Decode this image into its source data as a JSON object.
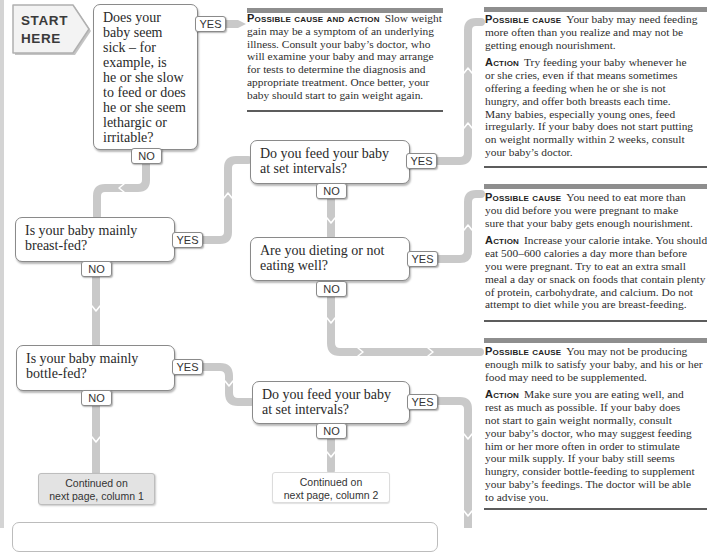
{
  "colors": {
    "connector": "#c9c9c9",
    "box_border": "#8a8a8a",
    "panel_bar": "#8e8e8e",
    "panel_rule": "#5c5c5c",
    "continued_fill": "#e3e3e3",
    "start_fill": "#f3f3f3"
  },
  "flowchart": {
    "start": {
      "line1": "START",
      "line2": "HERE"
    },
    "yes_label": "YES",
    "no_label": "NO",
    "questions": [
      {
        "id": "sick",
        "text": "Does your\nbaby seem\nsick – for\nexample, is\nhe or she slow\nto feed or does\nhe or she seem\nlethargic or\nirritable?"
      },
      {
        "id": "feed-set-intervals-breast",
        "text": "Do you feed your baby\nat set intervals?"
      },
      {
        "id": "dieting",
        "text": "Are you dieting or not\neating well?"
      },
      {
        "id": "breast-fed",
        "text": "Is your baby mainly\nbreast-fed?"
      },
      {
        "id": "bottle-fed",
        "text": "Is your baby mainly\nbottle-fed?"
      },
      {
        "id": "feed-set-intervals-bottle",
        "text": "Do you feed your baby\nat set intervals?"
      }
    ],
    "continued": [
      {
        "text": "Continued on\nnext page, column 1"
      },
      {
        "text": "Continued on\nnext page, column 2"
      }
    ]
  },
  "panels": [
    {
      "label": "Possible cause and action",
      "text": "Slow weight\ngain may be a symptom of an underlying\nillness. Consult your baby’s doctor, who\nwill examine your baby and may arrange\nfor tests to determine the diagnosis and\nappropriate treatment. Once better, your\nbaby should start to gain weight again."
    },
    {
      "cause_label": "Possible cause",
      "cause": "Your baby may need feeding\nmore often than you realize and may not be\ngetting enough nourishment.",
      "action_label": "Action",
      "action": "Try feeding your baby whenever he\nor she cries, even if that means sometimes\noffering a feeding when he or she is not\nhungry, and offer both breasts each time.\nMany babies, especially young ones, feed\nirregularly. If your baby does not start putting\non weight normally within 2 weeks, consult\nyour baby’s doctor."
    },
    {
      "cause_label": "Possible cause",
      "cause": "You need to eat more than\nyou did before you were pregnant to make\nsure that your baby gets enough nourishment.",
      "action_label": "Action",
      "action": "Increase your calorie intake. You should\neat 500–600 calories a day more than before\nyou were pregnant. Try to eat an extra small\nmeal a day or snack on foods that contain plenty\nof protein, carbohydrate, and calcium. Do not\nattempt to diet while you are breast-feeding."
    },
    {
      "cause_label": "Possible cause",
      "cause": "You may not be producing\nenough milk to satisfy your baby, and his or her\nfood may need to be supplemented.",
      "action_label": "Action",
      "action": "Make sure you are eating well, and\nrest as much as possible. If your baby does\nnot start to gain weight normally, consult\nyour baby’s doctor, who may suggest feeding\nhim or her more often in order to stimulate\nyour milk supply. If your baby still seems\nhungry, consider bottle-feeding to supplement\nyour baby’s feedings. The doctor will be able\nto advise you."
    }
  ]
}
